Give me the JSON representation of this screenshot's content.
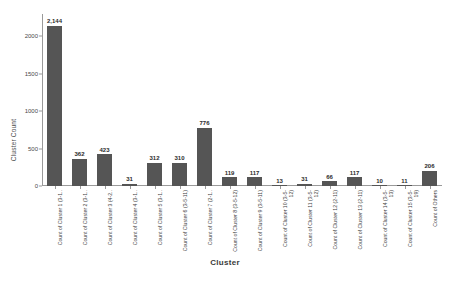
{
  "chart_data": {
    "type": "bar",
    "title": "",
    "xlabel": "Cluster",
    "ylabel": "Cluster Count",
    "ylim": [
      0,
      2300
    ],
    "yticks": [
      0,
      500,
      1000,
      1500,
      2000
    ],
    "ytick_labels": [
      "0",
      "500",
      "1000",
      "1500",
      "2000"
    ],
    "grid": false,
    "legend": null,
    "bar_color": "#555555",
    "categories": [
      "Count of Cluster 1 (3-1..",
      "Count of Cluster 2 (3-1..",
      "Count of Cluster 3 (4-2..",
      "Count of Cluster 4 (3-1..",
      "Count of Cluster 5 (3-1..",
      "Count of Cluster 6 (3-5-11)",
      "Count of Cluster 7 (2-1..",
      "Count of Cluster 8 (3-5-12)",
      "Count of Cluster 9 (3-5-11)",
      "Count of Cluster 10 (3-5-12)",
      "Count of Cluster 11 (3-5-12)",
      "Count of Cluster 12 (2-11)",
      "Count of Cluster 13 (2-11)",
      "Count of Cluster 14 (3-5-13)",
      "Count of Cluster 15 (3-5-19)",
      "Count of Others"
    ],
    "values": [
      2144,
      362,
      423,
      31,
      312,
      310,
      776,
      119,
      117,
      13,
      31,
      66,
      117,
      10,
      11,
      206
    ],
    "value_labels": [
      "2,144",
      "362",
      "423",
      "31",
      "312",
      "310",
      "776",
      "119",
      "117",
      "13",
      "31",
      "66",
      "117",
      "10",
      "11",
      "206"
    ]
  }
}
